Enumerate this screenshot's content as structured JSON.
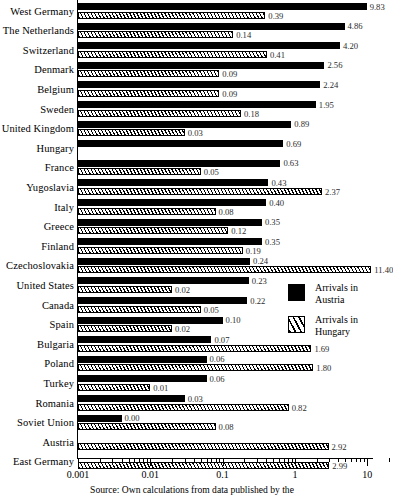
{
  "chart_data": {
    "type": "bar",
    "orientation": "horizontal",
    "title": "",
    "xlabel": "",
    "ylabel": "",
    "scale": "log",
    "xlim": [
      0.001,
      20
    ],
    "grid": false,
    "tick_labels": [
      "0.001",
      "0.01",
      "0.1",
      "1",
      "10"
    ],
    "tick_values": [
      0.001,
      0.01,
      0.1,
      1,
      10
    ],
    "legend_position": "right-middle",
    "categories": [
      "West Germany",
      "The Netherlands",
      "Switzerland",
      "Denmark",
      "Belgium",
      "Sweden",
      "United Kingdom",
      "Hungary",
      "France",
      "Yugoslavia",
      "Italy",
      "Greece",
      "Finland",
      "Czechoslovakia",
      "United States",
      "Canada",
      "Spain",
      "Bulgaria",
      "Poland",
      "Turkey",
      "Romania",
      "Soviet Union",
      "Austria",
      "East Germany"
    ],
    "series": [
      {
        "name": "Arrivals in Austria",
        "style": "solid-black",
        "values": [
          9.83,
          4.86,
          4.2,
          2.56,
          2.24,
          1.95,
          0.89,
          0.69,
          0.63,
          0.43,
          0.4,
          0.35,
          0.35,
          0.24,
          0.23,
          0.22,
          0.1,
          0.07,
          0.06,
          0.06,
          0.03,
          0.004,
          null,
          null
        ],
        "labels": [
          "9.83",
          "4.86",
          "4.20",
          "2.56",
          "2.24",
          "1.95",
          "0.89",
          "0.69",
          "0.63",
          "0.43",
          "0.40",
          "0.35",
          "0.35",
          "0.24",
          "0.23",
          "0.22",
          "0.10",
          "0.07",
          "0.06",
          "0.06",
          "0.03",
          "0.00",
          null,
          null
        ]
      },
      {
        "name": "Arrivals in Hungary",
        "style": "hatched",
        "values": [
          0.39,
          0.14,
          0.41,
          0.09,
          0.09,
          0.18,
          0.03,
          null,
          0.05,
          2.37,
          0.08,
          0.12,
          0.19,
          11.4,
          0.02,
          0.05,
          0.02,
          1.69,
          1.8,
          0.01,
          0.82,
          0.08,
          2.92,
          2.99
        ],
        "labels": [
          "0.39",
          "0.14",
          "0.41",
          "0.09",
          "0.09",
          "0.18",
          "0.03",
          null,
          "0.05",
          "2.37",
          "0.08",
          "0.12",
          "0.19",
          "11.40",
          "0.02",
          "0.05",
          "0.02",
          "1.69",
          "1.80",
          "0.01",
          "0.82",
          "0.08",
          "2.92",
          "2.99"
        ]
      }
    ]
  },
  "legend": {
    "items": [
      {
        "label": "Arrivals in\nAustria",
        "swatch": "solid-black-swatch"
      },
      {
        "label": "Arrivals in\nHungary",
        "swatch": "hatched-swatch"
      }
    ]
  },
  "source": {
    "text": "Source:  Own calculations from data published by the"
  },
  "colors": {
    "series_austria": "#000000",
    "series_hungary": "#ffffff",
    "axis": "#000000",
    "value_label": "#2b2b2b",
    "background": "#ffffff"
  }
}
